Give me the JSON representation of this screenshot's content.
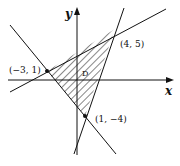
{
  "diagram": {
    "title": "",
    "axes": {
      "x_label": "x",
      "y_label": "y"
    },
    "region_label": "D",
    "vertices": [
      {
        "label": "(4, 5)",
        "x": 4,
        "y": 5
      },
      {
        "label": "(−3, 1)",
        "x": -3,
        "y": 1
      },
      {
        "label": "(1, −4)",
        "x": 1,
        "y": -4
      }
    ],
    "lines": [
      {
        "through": [
          "(−3, 1)",
          "(4, 5)"
        ]
      },
      {
        "through": [
          "(1, −4)",
          "(4, 5)"
        ]
      },
      {
        "through": [
          "(−3, 1)",
          "(1, −4)"
        ]
      }
    ],
    "shading": "hatched triangular region D",
    "colors": {
      "ink": "#111111",
      "background": "#ffffff"
    }
  }
}
